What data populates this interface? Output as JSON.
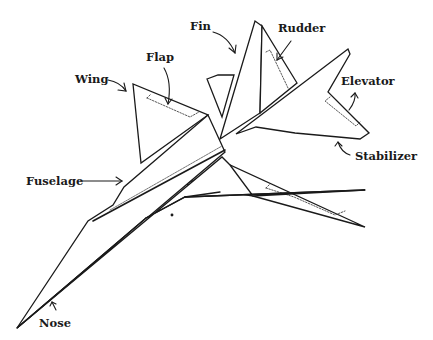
{
  "diagram": {
    "labels": [
      {
        "id": "fin",
        "text": "Fin",
        "x": 190,
        "y": 21
      },
      {
        "id": "rudder",
        "text": "Rudder",
        "x": 278,
        "y": 22
      },
      {
        "id": "flap",
        "text": "Flap",
        "x": 146,
        "y": 52
      },
      {
        "id": "wing",
        "text": "Wing",
        "x": 75,
        "y": 73
      },
      {
        "id": "elevator",
        "text": "Elevator",
        "x": 341,
        "y": 75
      },
      {
        "id": "stabilizer",
        "text": "Stabilizer",
        "x": 355,
        "y": 149
      },
      {
        "id": "fuselage",
        "text": "Fuselage",
        "x": 26,
        "y": 175
      },
      {
        "id": "nose",
        "text": "Nose",
        "x": 39,
        "y": 316
      }
    ],
    "colors": {
      "line": "#1a1a1a",
      "background": "#ffffff",
      "dotted": "#444444"
    }
  }
}
